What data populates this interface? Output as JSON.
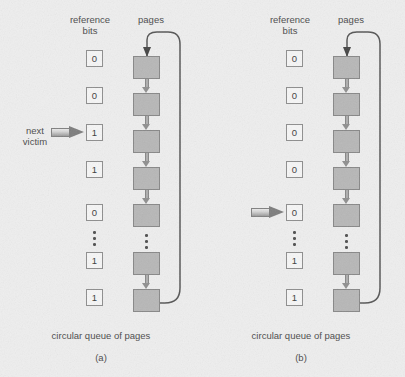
{
  "figure": {
    "background_color": "#eeeeee",
    "page_box_color": "#b7b7b7",
    "page_box_border_color": "#878787",
    "ref_box_color": "#f6f6f6",
    "ref_box_border_color": "#8d8d8d",
    "arrow_color": "#7d7d7d",
    "loop_color": "#555555",
    "ellipsis_glyph": "⋮"
  },
  "panels": [
    {
      "id": "a",
      "letter": "(a)",
      "header_reference_bits": "reference\nbits",
      "header_reference_line1": "reference",
      "header_reference_line2": "bits",
      "header_pages": "pages",
      "caption": "circular queue of pages",
      "pointer": {
        "label_line1": "next",
        "label_line2": "victim",
        "target_index": 2,
        "has_label": true
      },
      "reference_bits": [
        "0",
        "0",
        "1",
        "1",
        "0",
        "1",
        "1"
      ],
      "ellipsis_after_index": 4,
      "page_count": 7
    },
    {
      "id": "b",
      "letter": "(b)",
      "header_reference_bits": "reference\nbits",
      "header_reference_line1": "reference",
      "header_reference_line2": "bits",
      "header_pages": "pages",
      "caption": "circular queue of pages",
      "pointer": {
        "label_line1": "",
        "label_line2": "",
        "target_index": 4,
        "has_label": false
      },
      "reference_bits": [
        "0",
        "0",
        "0",
        "0",
        "0",
        "1",
        "1"
      ],
      "ellipsis_after_index": 4,
      "page_count": 7
    }
  ]
}
